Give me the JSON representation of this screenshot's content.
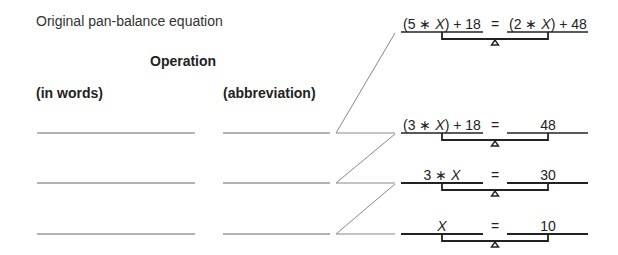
{
  "title": "Original pan-balance equation",
  "headers": {
    "operation": "Operation",
    "in_words": "(in words)",
    "abbreviation": "(abbreviation)"
  },
  "answer_blanks": [
    {
      "words": "",
      "abbreviation": ""
    },
    {
      "words": "",
      "abbreviation": ""
    },
    {
      "words": "",
      "abbreviation": ""
    }
  ],
  "equations": [
    {
      "left": "(5 ∗ X) + 18",
      "equals": "=",
      "right": "(2 ∗ X) + 48"
    },
    {
      "left": "(3 ∗ X) + 18",
      "equals": "=",
      "right": "48"
    },
    {
      "left": "3 ∗ X",
      "equals": "=",
      "right": "30"
    },
    {
      "left": "X",
      "equals": "=",
      "right": "10"
    }
  ]
}
